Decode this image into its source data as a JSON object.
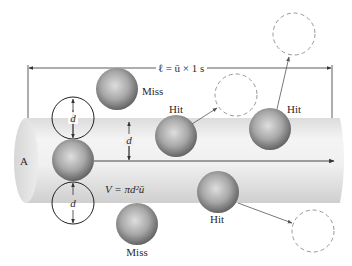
{
  "figure": {
    "length_label": "ℓ = ū × 1 s",
    "volume_label": "V = πd²ū",
    "area_label": "A",
    "diameter_label": "d",
    "labels": {
      "hit": "Hit",
      "miss": "Miss"
    },
    "colors": {
      "cylinder_light": "#f2f2f2",
      "cylinder_dark": "#d4d4d4",
      "sphere_light": "#d8d8d8",
      "sphere_dark": "#6a6a6a",
      "dashed_circle": "#8a8a8a",
      "line": "#333333"
    },
    "molecules": [
      {
        "id": "moving",
        "label": ""
      },
      {
        "id": "miss-top",
        "label": "Miss"
      },
      {
        "id": "hit-1",
        "label": "Hit"
      },
      {
        "id": "hit-2",
        "label": "Hit"
      },
      {
        "id": "hit-3",
        "label": "Hit"
      },
      {
        "id": "miss-bottom",
        "label": "Miss"
      }
    ]
  }
}
